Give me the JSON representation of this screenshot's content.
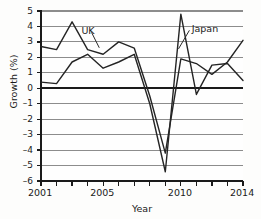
{
  "chart_data": {
    "type": "line",
    "title": "",
    "xlabel": "Year",
    "ylabel": "Growth (%)",
    "xlim": [
      2001,
      2014
    ],
    "ylim": [
      -6,
      5
    ],
    "grid": true,
    "legend_position": "inline-annotation",
    "x": [
      2001,
      2002,
      2003,
      2004,
      2005,
      2006,
      2007,
      2008,
      2009,
      2010,
      2011,
      2012,
      2013,
      2014
    ],
    "series": [
      {
        "name": "UK",
        "values": [
          2.7,
          2.5,
          4.3,
          2.5,
          2.2,
          3.0,
          2.6,
          -0.5,
          -4.2,
          1.9,
          1.6,
          0.9,
          1.7,
          3.1
        ]
      },
      {
        "name": "Japan",
        "values": [
          0.4,
          0.3,
          1.7,
          2.2,
          1.3,
          1.7,
          2.2,
          -1.0,
          -5.4,
          4.8,
          -0.4,
          1.5,
          1.6,
          0.5
        ]
      }
    ],
    "y_ticks": [
      5,
      4,
      3,
      2,
      1,
      0,
      -1,
      -2,
      -3,
      -4,
      -5,
      -6
    ],
    "y_tick_labels": [
      "5",
      "4",
      "3",
      "2",
      "1",
      "0",
      "–1",
      "–2",
      "–3",
      "–4",
      "–5",
      "–6"
    ],
    "x_ticks": [
      2001,
      2002,
      2003,
      2004,
      2005,
      2006,
      2007,
      2008,
      2009,
      2010,
      2011,
      2012,
      2013,
      2014
    ],
    "x_tick_labels_shown": [
      {
        "value": 2001,
        "label": "2001"
      },
      {
        "value": 2005,
        "label": "2005"
      },
      {
        "value": 2010,
        "label": "2010"
      },
      {
        "value": 2014,
        "label": "2014"
      }
    ],
    "annotations": [
      {
        "text": "UK",
        "points_to_series": "UK",
        "points_to_x": 2004
      },
      {
        "text": "Japan",
        "points_to_series": "Japan",
        "points_to_x": 2010
      }
    ],
    "colors": {
      "axis": "#1a1a1a",
      "grid": "#8c8c8c",
      "zero_line": "#1a1a1a",
      "uk_line": "#242424",
      "japan_line": "#242424"
    }
  }
}
